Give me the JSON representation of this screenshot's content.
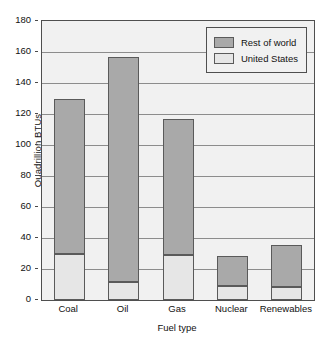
{
  "chart_data": {
    "type": "bar",
    "subtype": "stacked-vertical-bar",
    "title": "",
    "xlabel": "Fuel type",
    "ylabel": "Quadrillion BTUs",
    "categories": [
      "Coal",
      "Oil",
      "Gas",
      "Nuclear",
      "Renewables"
    ],
    "series": [
      {
        "name": "United States",
        "values": [
          30,
          11.5,
          29,
          9,
          8.5
        ],
        "color": "#e6e6e6"
      },
      {
        "name": "Rest of world",
        "values": [
          100,
          145.5,
          88,
          19.5,
          27
        ],
        "color": "#a9a9a9"
      }
    ],
    "stack_order_bottom_to_top": [
      "United States",
      "Rest of world"
    ],
    "totals": [
      130,
      157,
      117,
      28.5,
      35.5
    ],
    "ylim": [
      0,
      180
    ],
    "ytick_values": [
      0,
      20,
      40,
      60,
      80,
      100,
      120,
      140,
      160,
      180
    ],
    "ytick_labels": [
      "0",
      "20",
      "40",
      "60",
      "80",
      "100",
      "120",
      "140",
      "160",
      "180"
    ],
    "grid": {
      "horizontal": true,
      "vertical": false
    },
    "legend": {
      "position": "top-right-inside",
      "entries": [
        {
          "label": "Rest of world",
          "color": "#a9a9a9"
        },
        {
          "label": "United States",
          "color": "#e6e6e6"
        }
      ]
    },
    "plot_background": "#f1f1f1",
    "axis_color": "#4f4f4f"
  }
}
